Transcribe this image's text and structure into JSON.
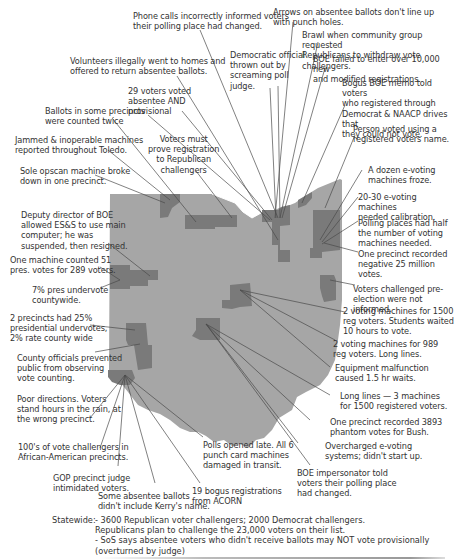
{
  "map": {
    "region": "Ohio",
    "colors": {
      "state_fill": "#a6a6a6",
      "problem_county_fill": "#7a7a7a",
      "leader_line": "#4a4a4a",
      "text": "#333333",
      "background": "#ffffff"
    }
  },
  "annotations": {
    "phone_calls": "Phone calls incorrectly informed voters\ntheir polling place had changed.",
    "arrows_absentee": "Arrows on absentee ballots don't line up\nwith punch holes.",
    "brawl": "Brawl when community group requested\nRepublicans to withdraw vote challengers.",
    "volunteers": "Volunteers illegally went to homes and\noffered to return absentee ballots.",
    "democratic_official": "Democratic official\nthrown out by\nscreaming poll\njudge.",
    "boe_failed": "BOE failed to enter over 10,000 new\nand modified registrations.",
    "bogus_memo": "Bogus BOE memo told voters\nwho registered through\nDemocrat & NAACP drives that\nthey could not vote.",
    "voted_twice": "29 voters voted\nabsentee AND\nprovisional",
    "counted_twice": "Ballots in some precincts\nwere counted twice",
    "person_voted": "Person voted using a\nregistered voters name.",
    "jammed": "Jammed & inoperable machines\nreported throughout Toledo.",
    "prove_registration": "Voters must\nprove registration\nto Republican\nchallengers",
    "sole_opscan": "Sole opscan machine broke\ndown in one precinct.",
    "dozen_froze": "A dozen e-voting\nmachines froze.",
    "calibration": "20-30 e-voting machines\nneeded calibration.",
    "deputy_director": "Deputy director of BOE\nallowed ES&S to use main\ncomputer; he was\nsuspended, then resigned.",
    "half_machines": "Polling places had half\nthe number of voting\nmachines needed.",
    "negative_votes": "One precinct recorded\nnegative 25 million\nvotes.",
    "one_machine": "One machine counted 51\npres. votes for 289 voters.",
    "undervote_7": "7% pres undervote\ncountywide.",
    "not_informed": "Voters challenged pre-\nelection were not informed.",
    "students": "2 voting machines for 1500\nreg voters. Students waited\n10 hours to vote.",
    "undervote_25": "2 precincts had 25%\npresidential undervotes,\n2% rate county wide",
    "machines_989": "2 voting machines for 989\nreg voters. Long lines.",
    "officials_prevented": "County officials prevented\npublic from observing\nvote counting.",
    "equipment": "Equipment malfunction\ncaused 1.5 hr waits.",
    "poor_directions": "Poor directions. Voters\nstand hours in the rain, at\nthe wrong precinct.",
    "long_lines_3": "Long lines — 3 machines\nfor 1500 registered voters.",
    "phantom_votes": "One precinct recorded 3893\nphantom votes for Bush.",
    "challengers_aa": "100's of vote challengers in\nAfrican-American precincts.",
    "polls_late": "Polls opened late. All 6\npunch card machines\ndamaged in transit.",
    "overcharged": "Overcharged e-voting\nsystems; didn't start up.",
    "gop_judge": "GOP precinct judge\nintimidated voters.",
    "boe_impersonator": "BOE impersonator told\nvoters their polling place\nhad changed.",
    "kerry_name": "Some absentee ballots\ndidn't include Kerry's name.",
    "acorn": "19 bogus registrations\nfrom ACORN"
  },
  "statewide": {
    "label": "Statewide:",
    "text": "- 3600 Republican voter challengers; 2000 Democrat challengers.\n  Republicans plan to challenge the 23,000 voters on their list.\n- SoS says absentee voters who didn't receive ballots may NOT vote provisionally\n  (overturned by judge)"
  }
}
